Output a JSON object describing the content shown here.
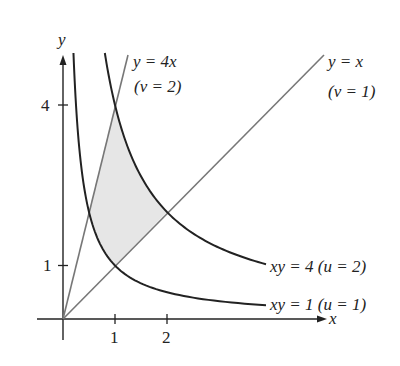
{
  "diagram": {
    "axes": {
      "x_label": "x",
      "y_label": "y",
      "x_ticks": [
        {
          "value": 1,
          "label": "1"
        },
        {
          "value": 2,
          "label": "2"
        }
      ],
      "y_ticks": [
        {
          "value": 1,
          "label": "1"
        },
        {
          "value": 4,
          "label": "4"
        }
      ]
    },
    "curves": [
      {
        "id": "line-y-eq-4x",
        "equation": "y = 4x",
        "param": "(v = 2)",
        "color": "#777777"
      },
      {
        "id": "line-y-eq-x",
        "equation": "y = x",
        "param": "(v = 1)",
        "color": "#777777"
      },
      {
        "id": "hyperbola-xy-4",
        "equation": "xy = 4",
        "param": "(u = 2)",
        "color": "#222222"
      },
      {
        "id": "hyperbola-xy-1",
        "equation": "xy = 1",
        "param": "(u = 1)",
        "color": "#222222"
      }
    ],
    "shaded_region": {
      "description": "Region bounded by y = x, y = 4x, xy = 1, xy = 4",
      "fill": "#e6e6e6"
    },
    "labels": {
      "y4x_eq": "y = 4x",
      "y4x_param": "(v = 2)",
      "yx_eq": "y = x",
      "yx_param": "(v = 1)",
      "xy4": "xy = 4 (u = 2)",
      "xy1": "xy = 1 (u = 1)"
    }
  }
}
